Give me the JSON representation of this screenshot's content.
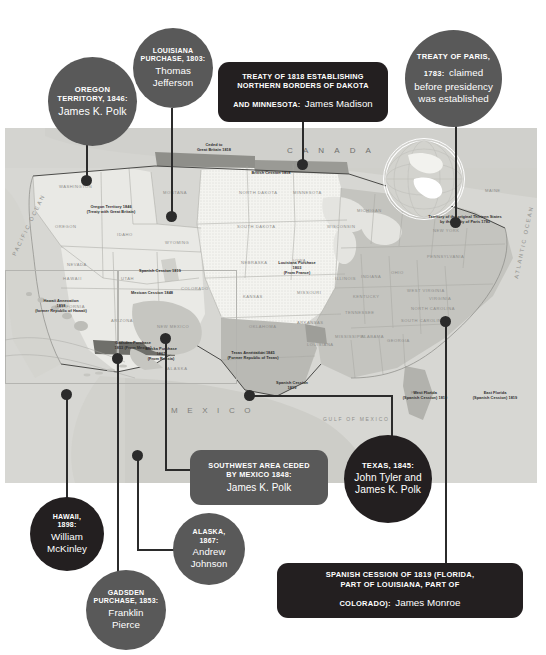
{
  "meta": {
    "figure_type": "annotated historical map infographic"
  },
  "callouts": [
    {
      "id": "oregon",
      "shape": "circle",
      "color": "#595959",
      "caption": "OREGON TERRITORY, 1846:",
      "name": "James K. Polk",
      "caption_lines": [
        "OREGON",
        "TERRITORY, 1846:"
      ]
    },
    {
      "id": "louisiana",
      "shape": "circle",
      "color": "#595959",
      "caption": "LOUISIANA PURCHASE, 1803:",
      "name": "Thomas Jefferson",
      "caption_lines": [
        "LOUISIANA",
        "PURCHASE, 1803:"
      ],
      "name_lines": [
        "Thomas",
        "Jefferson"
      ]
    },
    {
      "id": "treaty-1818",
      "shape": "rect",
      "color": "#231f20",
      "caption": "TREATY OF 1818 ESTABLISHING NORTHERN BORDERS OF DAKOTA AND MINNESOTA:",
      "name": "James Madison",
      "line1": "TREATY OF 1818 ESTABLISHING",
      "line2": "NORTHERN BORDERS OF DAKOTA",
      "line3_caption": "AND MINNESOTA:",
      "line3_name": "James Madison"
    },
    {
      "id": "treaty-paris",
      "shape": "circle",
      "color": "#595959",
      "caption": "TREATY OF PARIS, 1783:",
      "name": "claimed before presidency was established",
      "line1_caption": "TREATY OF PARIS,",
      "line2_caption": "1783:",
      "line2_name": "claimed",
      "line3_name": "before presidency",
      "line4_name": "was established"
    },
    {
      "id": "hawaii",
      "shape": "circle",
      "color": "#231f20",
      "caption": "HAWAII, 1898:",
      "name": "William McKinley",
      "caption_lines": [
        "HAWAII,",
        "1898:"
      ],
      "name_lines": [
        "William",
        "McKinley"
      ]
    },
    {
      "id": "gadsden",
      "shape": "circle",
      "color": "#595959",
      "caption": "GADSDEN PURCHASE, 1853:",
      "name": "Franklin Pierce",
      "caption_lines": [
        "GADSDEN",
        "PURCHASE, 1853:"
      ],
      "name_lines": [
        "Franklin",
        "Pierce"
      ]
    },
    {
      "id": "alaska",
      "shape": "circle",
      "color": "#595959",
      "caption": "ALASKA, 1867:",
      "name": "Andrew Johnson",
      "caption_lines": [
        "ALASKA,",
        "1867:"
      ],
      "name_lines": [
        "Andrew",
        "Johnson"
      ]
    },
    {
      "id": "southwest",
      "shape": "rect",
      "color": "#595959",
      "caption": "SOUTHWEST AREA CEDED BY MEXICO 1848:",
      "name": "James K. Polk",
      "line1": "SOUTHWEST AREA CEDED",
      "line2": "BY MEXICO 1848:",
      "line3_name": "James K. Polk"
    },
    {
      "id": "texas",
      "shape": "circle",
      "color": "#231f20",
      "caption": "TEXAS, 1845:",
      "name": "John Tyler and James K. Polk",
      "name_lines": [
        "John Tyler and",
        "James K. Polk"
      ]
    },
    {
      "id": "spanish-cession",
      "shape": "rect",
      "color": "#231f20",
      "caption": "SPANISH CESSION OF 1819 (FLORIDA, PART OF LOUISIANA, PART OF COLORADO):",
      "name": "James Monroe",
      "line1": "SPANISH CESSION OF 1819 (FLORIDA,",
      "line2": "PART OF LOUISIANA, PART OF",
      "line3_caption": "COLORADO):",
      "line3_name": "James Monroe"
    }
  ],
  "map": {
    "region_labels": {
      "canada": "C A N A D A",
      "mexico": "M E X I C O",
      "pacific_ocean": "PACIFIC OCEAN",
      "atlantic_ocean": "ATLANTIC OCEAN",
      "gulf": "GULF OF MEXICO",
      "hawaii_inset": "HAWAII",
      "alaska_inset": "ALASKA"
    },
    "states": [
      "WASHINGTON",
      "OREGON",
      "IDAHO",
      "MONTANA",
      "NORTH DAKOTA",
      "SOUTH DAKOTA",
      "WYOMING",
      "NEBRASKA",
      "IOWA",
      "MINNESOTA",
      "WISCONSIN",
      "MICHIGAN",
      "NEVADA",
      "UTAH",
      "COLORADO",
      "KANSAS",
      "MISSOURI",
      "ILLINOIS",
      "INDIANA",
      "OHIO",
      "CALIFORNIA",
      "ARIZONA",
      "NEW MEXICO",
      "OKLAHOMA",
      "ARKANSAS",
      "TENNESSEE",
      "KENTUCKY",
      "WEST VIRGINIA",
      "VIRGINIA",
      "PENNSYLVANIA",
      "NEW YORK",
      "MAINE",
      "TEXAS",
      "LOUISIANA",
      "MISSISSIPPI",
      "ALABAMA",
      "GEORGIA",
      "FLORIDA",
      "SOUTH CAROLINA",
      "NORTH CAROLINA",
      "NEW JERSEY",
      "MARYLAND",
      "DELAWARE",
      "VERMONT",
      "NEW HAMPSHIRE",
      "MASSACHUSETTS",
      "CONNECTICUT",
      "RHODE ISLAND"
    ],
    "annotations": [
      {
        "id": "ceded-britain",
        "lines": [
          "Ceded to",
          "Great Britain 1818"
        ]
      },
      {
        "id": "oregon-territory",
        "lines": [
          "Oregon Territory 1846",
          "(Treaty with Great Britain)"
        ]
      },
      {
        "id": "british-cession",
        "lines": [
          "British Cession 1818"
        ]
      },
      {
        "id": "louisiana-purchase",
        "lines": [
          "Louisiana Purchase",
          "1803",
          "(From France)"
        ]
      },
      {
        "id": "spanish-cession-west",
        "lines": [
          "Spanish Cession 1819"
        ]
      },
      {
        "id": "mexican-cession",
        "lines": [
          "Mexican Cession 1848"
        ]
      },
      {
        "id": "gadsden-purchase",
        "lines": [
          "Gadsden Purchase",
          "1853 (From Mexico)"
        ]
      },
      {
        "id": "texas-annexation",
        "lines": [
          "Texas Annexation 1845",
          "(Former Republic of Texas)"
        ]
      },
      {
        "id": "spanish-cession-south",
        "lines": [
          "Spanish Cession",
          "1819"
        ]
      },
      {
        "id": "west-florida",
        "lines": [
          "West Florida",
          "(Spanish Cession) 1819"
        ]
      },
      {
        "id": "east-florida",
        "lines": [
          "East Florida",
          "(Spanish Cession) 1819"
        ]
      },
      {
        "id": "treaty-paris-note",
        "lines": [
          "Territory of the original Thirteen States",
          "by the Treaty of Paris 1783"
        ]
      },
      {
        "id": "hawaii-annexation",
        "lines": [
          "Hawaii Annexation",
          "1898",
          "(former Republic of Hawaii)"
        ]
      },
      {
        "id": "alaska-purchase",
        "lines": [
          "Alaska Purchase",
          "1867",
          "(From Russia)"
        ]
      }
    ]
  },
  "colors": {
    "bubble_gray": "#595959",
    "bubble_black": "#231f20",
    "connector": "#2b2b2b",
    "map_land": "#c9c9c4",
    "map_light": "#eeeeea",
    "page_bg": "#ffffff"
  }
}
